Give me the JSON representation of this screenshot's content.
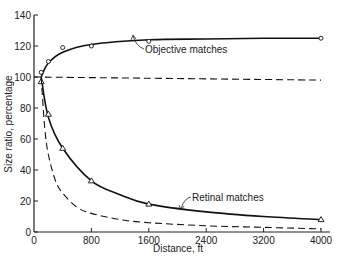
{
  "chart_data": {
    "type": "line",
    "title": "",
    "xlabel": "Distance, ft",
    "ylabel": "Size ratio, percentage",
    "xlim": [
      0,
      4000
    ],
    "ylim": [
      0,
      140
    ],
    "xticks": [
      0,
      800,
      1600,
      2400,
      3200,
      4000
    ],
    "yticks": [
      0,
      20,
      40,
      60,
      80,
      100,
      120,
      140
    ],
    "grid": false,
    "legend": "none (inline annotations)",
    "annotations": [
      "Objective matches",
      "Retinal matches"
    ],
    "series": [
      {
        "name": "Objective matches",
        "style": "solid line with circle markers",
        "points": [
          [
            100,
            103
          ],
          [
            200,
            110
          ],
          [
            400,
            119
          ],
          [
            800,
            120
          ],
          [
            1600,
            123
          ],
          [
            4000,
            125
          ]
        ],
        "curve": [
          [
            100,
            100
          ],
          [
            200,
            109
          ],
          [
            400,
            116
          ],
          [
            800,
            121
          ],
          [
            1600,
            124
          ],
          [
            2400,
            124.5
          ],
          [
            3200,
            125
          ],
          [
            4000,
            125
          ]
        ]
      },
      {
        "name": "Retinal matches",
        "style": "solid line with triangle markers",
        "points": [
          [
            100,
            97
          ],
          [
            200,
            76
          ],
          [
            400,
            54
          ],
          [
            800,
            33
          ],
          [
            1600,
            18
          ],
          [
            4000,
            8
          ]
        ],
        "curve": [
          [
            100,
            100
          ],
          [
            200,
            74
          ],
          [
            400,
            54
          ],
          [
            800,
            33
          ],
          [
            1200,
            24
          ],
          [
            1600,
            18
          ],
          [
            2400,
            13
          ],
          [
            3200,
            10
          ],
          [
            4000,
            8
          ]
        ]
      },
      {
        "name": "Size constancy (100%)",
        "style": "dashed line",
        "curve": [
          [
            0,
            100
          ],
          [
            4000,
            98
          ]
        ]
      },
      {
        "name": "Retinal size prediction",
        "style": "dashed line",
        "curve": [
          [
            100,
            100
          ],
          [
            150,
            67
          ],
          [
            200,
            50
          ],
          [
            300,
            33
          ],
          [
            400,
            25
          ],
          [
            600,
            16
          ],
          [
            800,
            12
          ],
          [
            1200,
            8
          ],
          [
            1600,
            6
          ],
          [
            2400,
            4
          ],
          [
            3200,
            3
          ],
          [
            4000,
            2
          ]
        ]
      }
    ]
  }
}
